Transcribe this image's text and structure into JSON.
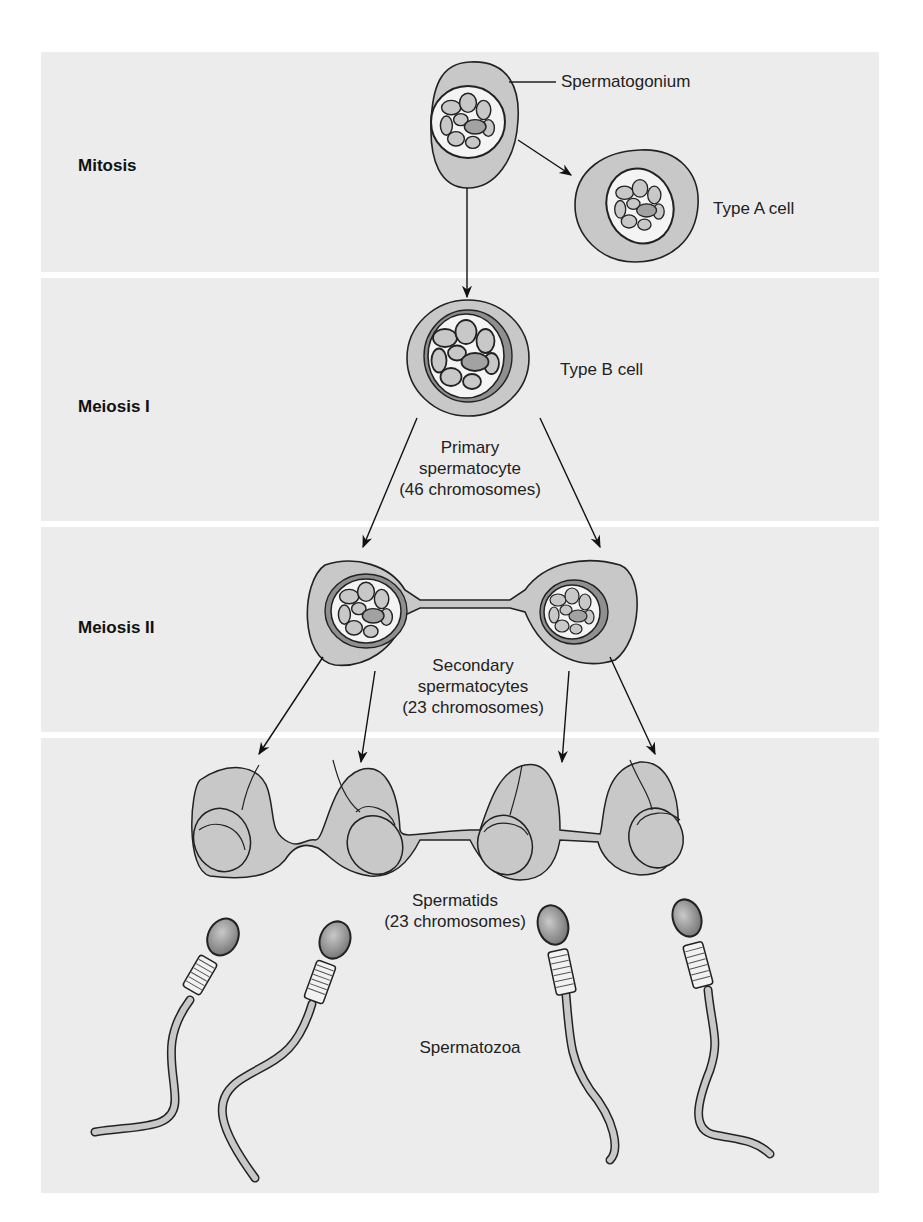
{
  "bands": [
    {
      "label": "Mitosis"
    },
    {
      "label": "Meiosis I"
    },
    {
      "label": "Meiosis II"
    },
    {
      "label": ""
    }
  ],
  "labels": {
    "spermatogonium": "Spermatogonium",
    "type_a": "Type A cell",
    "type_b": "Type B cell",
    "primary_line1": "Primary",
    "primary_line2": "spermatocyte",
    "primary_line3": "(46 chromosomes)",
    "secondary_line1": "Secondary",
    "secondary_line2": "spermatocytes",
    "secondary_line3": "(23 chromosomes)",
    "spermatids_line1": "Spermatids",
    "spermatids_line2": "(23 chromosomes)",
    "spermatozoa": "Spermatozoa"
  },
  "colors": {
    "band": "#ececec",
    "cytoplasm": "#c8c8c8",
    "nucleus": "#f4f4f4",
    "nucleolus": "#a6a6a6",
    "outline": "#2a2a2a"
  }
}
